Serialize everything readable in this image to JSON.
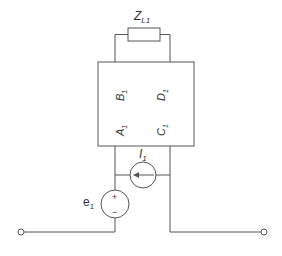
{
  "diagram": {
    "type": "circuit",
    "colors": {
      "line": "#555555",
      "text": "#333333",
      "background": "#ffffff"
    },
    "load": {
      "label_main": "Z",
      "label_sub": "L1"
    },
    "two_port": {
      "params": [
        {
          "main": "A",
          "sub": "1"
        },
        {
          "main": "B",
          "sub": "1"
        },
        {
          "main": "C",
          "sub": "1"
        },
        {
          "main": "D",
          "sub": "1"
        }
      ]
    },
    "current_source": {
      "label_main": "I",
      "label_sub": "1",
      "direction": "left"
    },
    "voltage_source": {
      "label_main": "e",
      "label_sub": "1",
      "plus": "+",
      "minus": "−"
    },
    "terminals": [
      "left-terminal",
      "right-terminal"
    ]
  }
}
